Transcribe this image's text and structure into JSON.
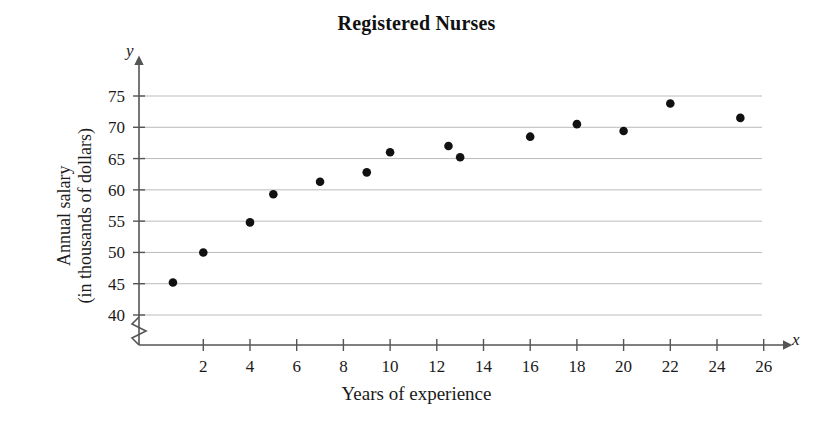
{
  "chart_data": {
    "type": "scatter",
    "title": "Registered Nurses",
    "xlabel": "Years of experience",
    "ylabel_line1": "Annual salary",
    "ylabel_line2": "(in thousands of dollars)",
    "x_axis_variable": "x",
    "y_axis_variable": "y",
    "xlim": [
      0,
      27
    ],
    "ylim": [
      40,
      76
    ],
    "y_axis_break": true,
    "grid": "horizontal",
    "legend": null,
    "xticks": [
      2,
      4,
      6,
      8,
      10,
      12,
      14,
      16,
      18,
      20,
      22,
      24,
      26
    ],
    "yticks": [
      40,
      45,
      50,
      55,
      60,
      65,
      70,
      75
    ],
    "xtick_labels": [
      "2",
      "4",
      "6",
      "8",
      "10",
      "12",
      "14",
      "16",
      "18",
      "20",
      "22",
      "24",
      "26"
    ],
    "ytick_labels": [
      "40",
      "45",
      "50",
      "55",
      "60",
      "65",
      "70",
      "75"
    ],
    "marker_color": "#111111",
    "grid_color": "#bbbbbb",
    "axis_color": "#555555",
    "points": [
      {
        "x": 0.7,
        "y": 45.2
      },
      {
        "x": 2,
        "y": 50.0
      },
      {
        "x": 4,
        "y": 54.8
      },
      {
        "x": 5,
        "y": 59.3
      },
      {
        "x": 7,
        "y": 61.3
      },
      {
        "x": 9,
        "y": 62.8
      },
      {
        "x": 10,
        "y": 66.0
      },
      {
        "x": 12.5,
        "y": 67.0
      },
      {
        "x": 13,
        "y": 65.2
      },
      {
        "x": 16,
        "y": 68.5
      },
      {
        "x": 18,
        "y": 70.5
      },
      {
        "x": 20,
        "y": 69.4
      },
      {
        "x": 22,
        "y": 73.8
      },
      {
        "x": 25,
        "y": 71.5
      }
    ]
  }
}
